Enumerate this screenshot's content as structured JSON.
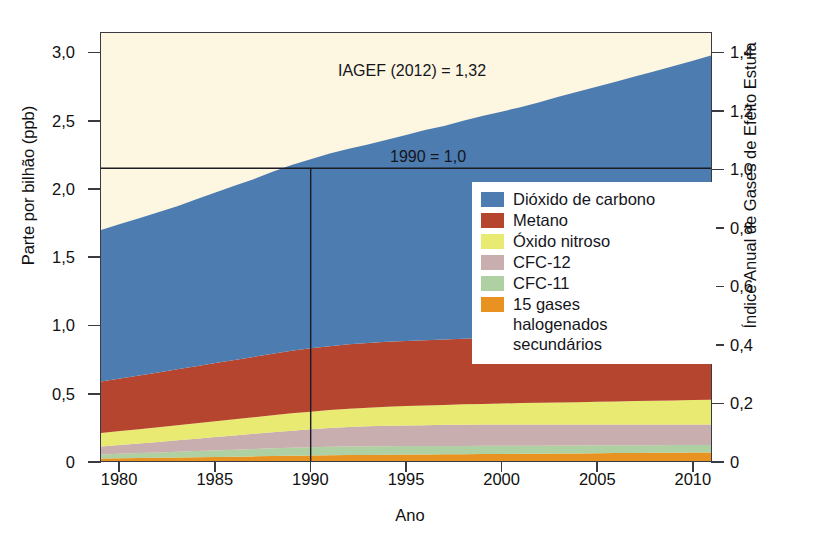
{
  "chart_data": {
    "type": "area",
    "stacked": true,
    "title": "",
    "xlabel": "Ano",
    "ylabel": "Parte por bilhão (ppb)",
    "ylabel_right": "Índice Anual de Gases de Efeito Estufa",
    "xlim": [
      1979,
      2011
    ],
    "ylim": [
      0,
      3.15
    ],
    "ylim_right": [
      0,
      1.47
    ],
    "grid": false,
    "legend_position": "inside-center-right",
    "x": [
      1979,
      1980,
      1981,
      1982,
      1983,
      1984,
      1985,
      1986,
      1987,
      1988,
      1989,
      1990,
      1991,
      1992,
      1993,
      1994,
      1995,
      1996,
      1997,
      1998,
      1999,
      2000,
      2001,
      2002,
      2003,
      2004,
      2005,
      2006,
      2007,
      2008,
      2009,
      2010,
      2011
    ],
    "xticks": [
      1980,
      1985,
      1990,
      1995,
      2000,
      2005,
      2010
    ],
    "xticklabels": [
      "1980",
      "1985",
      "1990",
      "1995",
      "2000",
      "2005",
      "2010"
    ],
    "yticks": [
      0,
      0.5,
      1.0,
      1.5,
      2.0,
      2.5,
      3.0
    ],
    "yticklabels": [
      "0",
      "0,5",
      "1,0",
      "1,5",
      "2,0",
      "2,5",
      "3,0"
    ],
    "yticks_right": [
      0,
      0.2,
      0.4,
      0.6,
      0.8,
      1.0,
      1.2,
      1.4
    ],
    "yticklabels_right": [
      "0",
      "0,2",
      "0,4",
      "0,6",
      "0,8",
      "1,0",
      "1,2",
      "1,4"
    ],
    "series": [
      {
        "name": "15 gases halogenados secundários",
        "color": "#e89321",
        "values": [
          0.018,
          0.02,
          0.022,
          0.024,
          0.026,
          0.028,
          0.03,
          0.032,
          0.034,
          0.036,
          0.038,
          0.04,
          0.042,
          0.044,
          0.045,
          0.046,
          0.047,
          0.048,
          0.049,
          0.05,
          0.051,
          0.052,
          0.053,
          0.054,
          0.055,
          0.056,
          0.057,
          0.058,
          0.059,
          0.06,
          0.061,
          0.062,
          0.063
        ]
      },
      {
        "name": "CFC-11",
        "color": "#aed0a2",
        "values": [
          0.03,
          0.033,
          0.036,
          0.039,
          0.042,
          0.045,
          0.048,
          0.051,
          0.054,
          0.057,
          0.059,
          0.061,
          0.062,
          0.063,
          0.063,
          0.063,
          0.063,
          0.062,
          0.062,
          0.061,
          0.061,
          0.06,
          0.06,
          0.059,
          0.059,
          0.058,
          0.058,
          0.057,
          0.057,
          0.056,
          0.056,
          0.055,
          0.055
        ]
      },
      {
        "name": "CFC-12",
        "color": "#c9aeb0",
        "values": [
          0.058,
          0.064,
          0.07,
          0.077,
          0.084,
          0.091,
          0.098,
          0.105,
          0.112,
          0.119,
          0.126,
          0.132,
          0.138,
          0.143,
          0.147,
          0.15,
          0.152,
          0.154,
          0.155,
          0.156,
          0.156,
          0.156,
          0.156,
          0.155,
          0.155,
          0.154,
          0.154,
          0.153,
          0.153,
          0.152,
          0.152,
          0.151,
          0.151
        ]
      },
      {
        "name": "Óxido nitroso",
        "color": "#e9ea72",
        "values": [
          0.1,
          0.103,
          0.106,
          0.108,
          0.111,
          0.114,
          0.117,
          0.119,
          0.122,
          0.125,
          0.128,
          0.13,
          0.133,
          0.135,
          0.137,
          0.14,
          0.142,
          0.145,
          0.147,
          0.15,
          0.152,
          0.155,
          0.157,
          0.16,
          0.162,
          0.165,
          0.167,
          0.17,
          0.172,
          0.175,
          0.177,
          0.18,
          0.182
        ]
      },
      {
        "name": "Metano",
        "color": "#b5452f",
        "values": [
          0.38,
          0.388,
          0.396,
          0.404,
          0.412,
          0.42,
          0.428,
          0.436,
          0.444,
          0.452,
          0.46,
          0.466,
          0.47,
          0.474,
          0.476,
          0.478,
          0.479,
          0.48,
          0.481,
          0.483,
          0.484,
          0.484,
          0.484,
          0.485,
          0.485,
          0.485,
          0.485,
          0.486,
          0.487,
          0.488,
          0.489,
          0.49,
          0.491
        ]
      },
      {
        "name": "Dióxido de carbono",
        "color": "#4d7cb1",
        "values": [
          1.115,
          1.137,
          1.157,
          1.178,
          1.2,
          1.228,
          1.255,
          1.282,
          1.308,
          1.34,
          1.368,
          1.392,
          1.418,
          1.44,
          1.462,
          1.488,
          1.516,
          1.548,
          1.572,
          1.605,
          1.636,
          1.664,
          1.694,
          1.728,
          1.764,
          1.8,
          1.834,
          1.868,
          1.902,
          1.936,
          1.97,
          2.006,
          2.043
        ]
      }
    ],
    "top_fill_color": "#fdf6e0",
    "annotations": [
      {
        "id": "iagef",
        "text": "IAGEF (2012) = 1,32",
        "x": 1993.5,
        "y": 2.93
      },
      {
        "id": "ref1990",
        "text": "1990 = 1,0",
        "x": 1996.8,
        "y": 2.28
      }
    ],
    "reference_lines": [
      {
        "id": "v1990",
        "orientation": "vertical",
        "x": 1990,
        "label": "1990"
      },
      {
        "id": "h1990",
        "orientation": "horizontal",
        "y": 2.155,
        "right_value": 1.0
      }
    ]
  },
  "legend": {
    "items": [
      {
        "label": "Dióxido de carbono",
        "color": "#4d7cb1"
      },
      {
        "label": "Metano",
        "color": "#b5452f"
      },
      {
        "label": "Óxido nitroso",
        "color": "#e9ea72"
      },
      {
        "label": "CFC-12",
        "color": "#c9aeb0"
      },
      {
        "label": "CFC-11",
        "color": "#aed0a2"
      },
      {
        "label": "15 gases\nhalogenados\nsecundários",
        "color": "#e89321"
      }
    ]
  },
  "axes": {
    "left_title": "Parte por bilhão (ppb)",
    "right_title": "Índice Anual de Gases de Efeito Estufa",
    "bottom_title": "Ano"
  }
}
